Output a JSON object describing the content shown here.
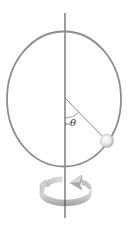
{
  "diagram": {
    "title": "",
    "labels": {
      "angle": "θ"
    },
    "elements": {
      "hoop": "vertical-circular-hoop",
      "axis": "vertical-rotation-axis",
      "bead": "bead-on-hoop",
      "radius_line": "line-from-center-to-bead",
      "angle_arc": "angle-theta-arc",
      "rotation_arrow": "circular-rotation-arrow"
    },
    "colors": {
      "hoop": "#8a8a8a",
      "axis": "#3a3a3a",
      "bead_light": "#ffffff",
      "bead_dark": "#b0b0b0",
      "arrow_light": "#e6e6e6",
      "arrow_dark": "#9a9a9a"
    }
  }
}
